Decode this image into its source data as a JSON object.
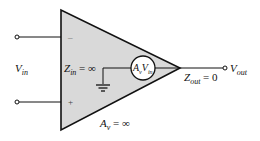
{
  "diagram": {
    "colors": {
      "body_fill": "#d9d9d9",
      "stroke": "#111111",
      "background": "#ffffff"
    },
    "labels": {
      "vin": {
        "main": "V",
        "sub": "in"
      },
      "zin": {
        "main": "Z",
        "sub": "in",
        "rest": " = ∞"
      },
      "source": {
        "a": "A",
        "a_sub": "v",
        "v": "V",
        "v_sub": "in"
      },
      "zout": {
        "main": "Z",
        "sub": "out",
        "rest": " = 0"
      },
      "vout": {
        "main": "V",
        "sub": "out"
      },
      "av": {
        "main": "A",
        "sub": "v",
        "rest": " = ∞"
      },
      "minus": "–",
      "plus": "+"
    }
  }
}
